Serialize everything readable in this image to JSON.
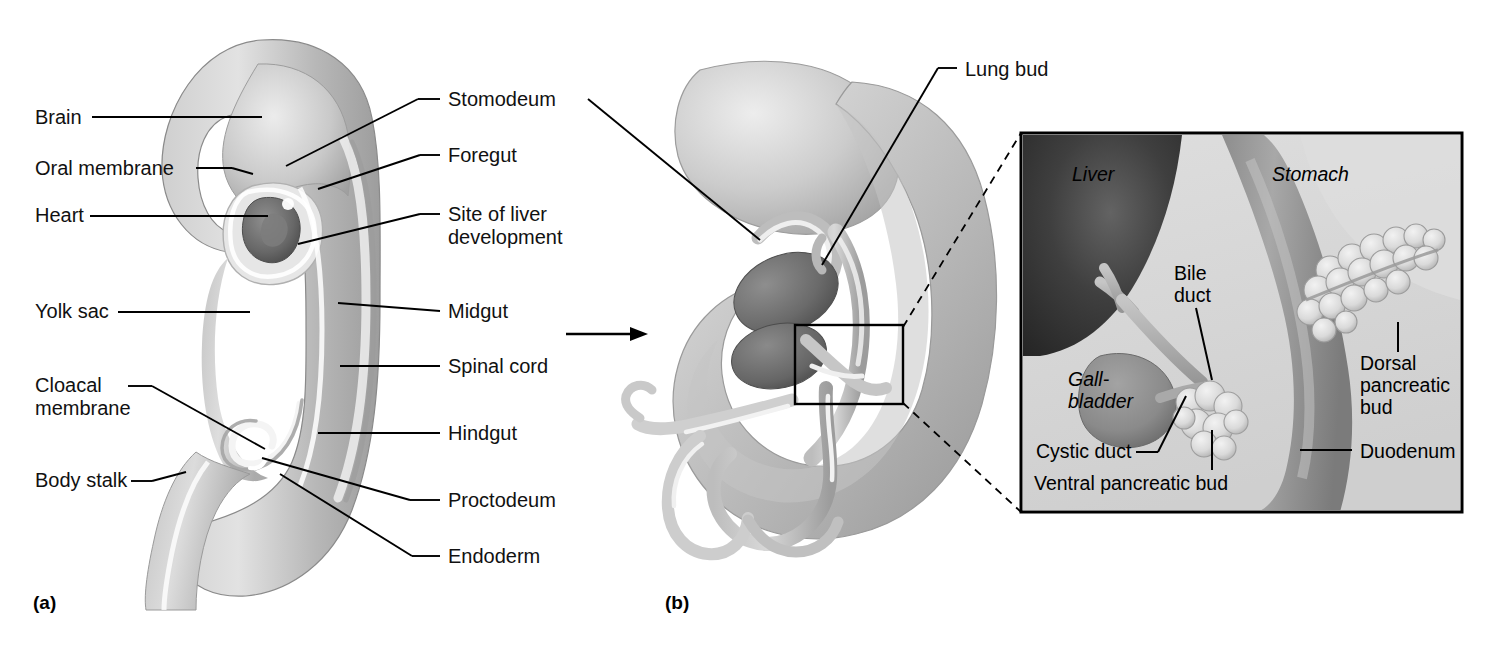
{
  "figure": {
    "panels": [
      {
        "caption": "(a)",
        "x": 33,
        "y": 592
      },
      {
        "caption": "(b)",
        "x": 665,
        "y": 592
      }
    ]
  },
  "panel_a": {
    "labels_left": [
      {
        "text": "Brain",
        "x": 35,
        "y": 106,
        "leader_to_x": 262,
        "leader_to_y": 117
      },
      {
        "text": "Oral membrane",
        "x": 35,
        "y": 157,
        "leader_to_x": 253,
        "leader_to_y": 172
      },
      {
        "text": "Heart",
        "x": 35,
        "y": 204,
        "leader_to_x": 268,
        "leader_to_y": 216
      },
      {
        "text": "Yolk sac",
        "x": 35,
        "y": 300,
        "leader_to_x": 250,
        "leader_to_y": 312
      },
      {
        "text": "Cloacal",
        "x": 35,
        "y": 385,
        "leader_to_x": 263,
        "leader_to_y": 448
      },
      {
        "text": "membrane",
        "x": 35,
        "y": 408
      },
      {
        "text": "Body stalk",
        "x": 35,
        "y": 479,
        "leader_to_x": 186,
        "leader_to_y": 481
      }
    ],
    "labels_right": [
      {
        "text": "Stomodeum",
        "x": 448,
        "y": 88,
        "leader_to_x": 286,
        "leader_to_y": 165
      },
      {
        "text": "Foregut",
        "x": 448,
        "y": 144,
        "leader_to_x": 318,
        "leader_to_y": 188
      },
      {
        "text": "Site of liver",
        "x": 448,
        "y": 203,
        "leader_to_x": 298,
        "leader_to_y": 243
      },
      {
        "text": "development",
        "x": 448,
        "y": 226
      },
      {
        "text": "Midgut",
        "x": 448,
        "y": 300,
        "leader_to_x": 338,
        "leader_to_y": 297
      },
      {
        "text": "Spinal cord",
        "x": 448,
        "y": 355,
        "leader_to_x": 340,
        "leader_to_y": 364
      },
      {
        "text": "Hindgut",
        "x": 448,
        "y": 422,
        "leader_to_x": 318,
        "leader_to_y": 428
      },
      {
        "text": "Proctodeum",
        "x": 448,
        "y": 489,
        "leader_to_x": 262,
        "leader_to_y": 458
      },
      {
        "text": "Endoderm",
        "x": 448,
        "y": 545,
        "leader_to_x": 280,
        "leader_to_y": 475
      }
    ]
  },
  "panel_b": {
    "labels": [
      {
        "text": "Lung bud",
        "x": 965,
        "y": 58,
        "leader_to_x": 838,
        "leader_to_y": 252
      }
    ],
    "arrow": {
      "x1": 566,
      "y1": 334,
      "x2": 648,
      "y2": 334
    },
    "zoom_box": {
      "x": 795,
      "y": 325,
      "w": 108,
      "h": 79
    }
  },
  "inset": {
    "frame": {
      "x": 1021,
      "y": 133,
      "w": 441,
      "h": 379
    },
    "organ_labels": [
      {
        "text": "Liver",
        "x": 1072,
        "y": 163,
        "italic": true
      },
      {
        "text": "Stomach",
        "x": 1272,
        "y": 163,
        "italic": true
      },
      {
        "text": "Gall-",
        "x": 1068,
        "y": 368,
        "italic": true
      },
      {
        "text": "bladder",
        "x": 1068,
        "y": 390,
        "italic": true
      }
    ],
    "leader_labels": [
      {
        "text": "Bile",
        "x": 1174,
        "y": 272
      },
      {
        "text": "duct",
        "x": 1174,
        "y": 294
      },
      {
        "text": "Dorsal",
        "x": 1360,
        "y": 362
      },
      {
        "text": "pancreatic",
        "x": 1360,
        "y": 384
      },
      {
        "text": "bud",
        "x": 1360,
        "y": 406
      },
      {
        "text": "Cystic duct",
        "x": 1036,
        "y": 447
      },
      {
        "text": "Ventral pancreatic bud",
        "x": 1034,
        "y": 478
      },
      {
        "text": "Duodenum",
        "x": 1360,
        "y": 446
      }
    ]
  },
  "colors": {
    "line": "#000000",
    "inset_bg_light": "#d9d9d9",
    "inset_liver_dark": "#3a3a3a",
    "inset_organ_mid": "#9a9a9a",
    "embryo_light": "#d2d2d2",
    "embryo_mid": "#b5b5b5",
    "embryo_dark": "#8e8e8e",
    "heart_dark": "#6e6e6e"
  }
}
